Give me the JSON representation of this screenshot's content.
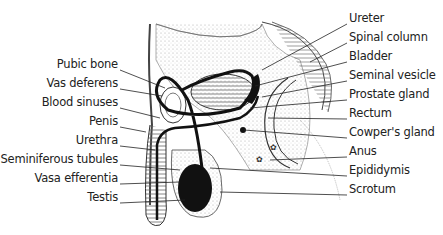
{
  "diagram": {
    "type": "anatomical-cross-section",
    "left_labels": [
      {
        "text": "Pubic bone",
        "x": 118,
        "y": 64
      },
      {
        "text": "Vas deferens",
        "x": 118,
        "y": 83
      },
      {
        "text": "Blood sinuses",
        "x": 118,
        "y": 102
      },
      {
        "text": "Penis",
        "x": 118,
        "y": 121
      },
      {
        "text": "Urethra",
        "x": 118,
        "y": 140
      },
      {
        "text": "Seminiferous tubules",
        "x": 118,
        "y": 159
      },
      {
        "text": "Vasa efferentia",
        "x": 118,
        "y": 178
      },
      {
        "text": "Testis",
        "x": 118,
        "y": 197
      }
    ],
    "right_labels": [
      {
        "text": "Ureter",
        "x": 349,
        "y": 18
      },
      {
        "text": "Spinal column",
        "x": 349,
        "y": 37
      },
      {
        "text": "Bladder",
        "x": 349,
        "y": 56
      },
      {
        "text": "Seminal vesicle",
        "x": 349,
        "y": 75
      },
      {
        "text": "Prostate gland",
        "x": 349,
        "y": 94
      },
      {
        "text": "Rectum",
        "x": 349,
        "y": 113
      },
      {
        "text": "Cowper's gland",
        "x": 349,
        "y": 132
      },
      {
        "text": "Anus",
        "x": 349,
        "y": 151
      },
      {
        "text": "Epididymis",
        "x": 349,
        "y": 170
      },
      {
        "text": "Scrotum",
        "x": 349,
        "y": 189
      }
    ],
    "colors": {
      "line": "#222222",
      "stipple": "#bbbbbb",
      "duct": "#111111"
    }
  }
}
